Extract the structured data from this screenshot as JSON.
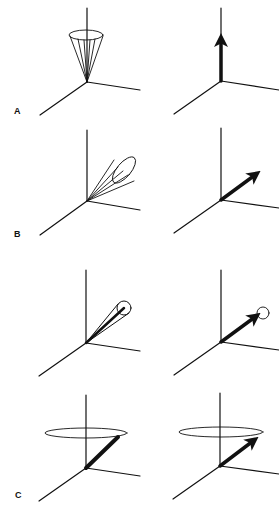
{
  "figure": {
    "panels": [
      {
        "label": "A",
        "left": "cone-precession-vertical",
        "right": "net-vector-vertical"
      },
      {
        "label": "B",
        "left": "cone-precession-tilted",
        "right": "net-vector-tilted"
      },
      {
        "label": "",
        "left": "narrow-cone-tilted",
        "right": "net-vector-tilted-with-circle"
      },
      {
        "label": "C",
        "left": "precession-orbit-vector",
        "right": "precession-orbit-net-vector"
      }
    ],
    "colors": {
      "line": "#111111",
      "background": "#ffffff"
    }
  }
}
